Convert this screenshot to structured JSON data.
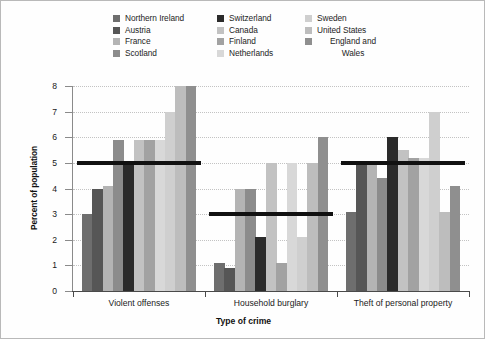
{
  "legend": {
    "columns": [
      [
        {
          "label": "Northern Ireland",
          "color": "#6e6e6e"
        },
        {
          "label": "Austria",
          "color": "#565656"
        },
        {
          "label": "France",
          "color": "#b4b4b4"
        },
        {
          "label": "Scotland",
          "color": "#8c8c8c"
        }
      ],
      [
        {
          "label": "Switzerland",
          "color": "#2b2b2b"
        },
        {
          "label": "Canada",
          "color": "#c2c2c2"
        },
        {
          "label": "Finland",
          "color": "#a2a2a2"
        },
        {
          "label": "Netherlands",
          "color": "#d8d8d8"
        }
      ],
      [
        {
          "label": "Sweden",
          "color": "#cfcfcf"
        },
        {
          "label": "United States",
          "color": "#bdbdbd"
        },
        {
          "label": "England and\nWales",
          "color": "#8f8f8f"
        }
      ]
    ]
  },
  "chart_data": {
    "type": "bar",
    "title": "",
    "xlabel": "Type of crime",
    "ylabel": "Percent of population",
    "ylim": [
      0,
      8
    ],
    "yticks": [
      0,
      1,
      2,
      3,
      4,
      5,
      6,
      7,
      8
    ],
    "ytick_labels": [
      "0",
      "1",
      "2",
      "3",
      "4",
      "5",
      "6",
      "7",
      "8"
    ],
    "grid": true,
    "legend_position": "top",
    "categories": [
      "Violent offenses",
      "Household burglary",
      "Theft of personal property"
    ],
    "series": [
      {
        "name": "Northern Ireland",
        "color": "#6e6e6e",
        "values": [
          3.0,
          1.1,
          3.1
        ]
      },
      {
        "name": "Austria",
        "color": "#565656",
        "values": [
          4.0,
          0.9,
          4.9
        ]
      },
      {
        "name": "France",
        "color": "#b4b4b4",
        "values": [
          4.1,
          4.0,
          5.0
        ]
      },
      {
        "name": "Scotland",
        "color": "#8c8c8c",
        "values": [
          5.9,
          4.0,
          4.4
        ]
      },
      {
        "name": "Switzerland",
        "color": "#2b2b2b",
        "values": [
          5.0,
          2.1,
          6.0
        ]
      },
      {
        "name": "Canada",
        "color": "#c2c2c2",
        "values": [
          5.9,
          5.0,
          5.5
        ]
      },
      {
        "name": "Finland",
        "color": "#a2a2a2",
        "values": [
          5.9,
          1.1,
          5.2
        ]
      },
      {
        "name": "Netherlands",
        "color": "#d8d8d8",
        "values": [
          5.9,
          5.0,
          5.2
        ]
      },
      {
        "name": "Sweden",
        "color": "#cfcfcf",
        "values": [
          7.0,
          2.1,
          7.0
        ]
      },
      {
        "name": "United States",
        "color": "#bdbdbd",
        "values": [
          8.0,
          5.0,
          3.1
        ]
      },
      {
        "name": "England and Wales",
        "color": "#8f8f8f",
        "values": [
          8.0,
          6.0,
          4.1
        ]
      }
    ],
    "reference_lines": [
      {
        "category": "Violent offenses",
        "value": 5.0,
        "color": "#111111"
      },
      {
        "category": "Household burglary",
        "value": 3.0,
        "color": "#111111"
      },
      {
        "category": "Theft of personal property",
        "value": 5.0,
        "color": "#111111"
      }
    ]
  }
}
